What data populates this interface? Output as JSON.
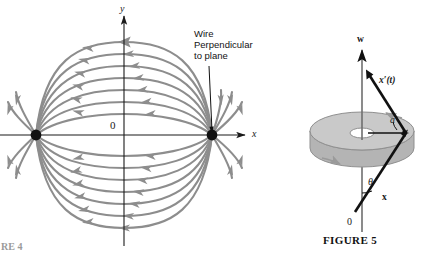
{
  "figure": {
    "caption": "FIGURE 5",
    "caption_stub_left": "RE 4"
  },
  "left_panel": {
    "name": "magnetic-field-lines-diagram",
    "axes": {
      "x_label": "x",
      "y_label": "y",
      "origin_label": "0"
    },
    "callout": {
      "line1": "Wire",
      "line2": "Perpendicular",
      "line3": "to plane"
    },
    "poles": [
      {
        "name": "left-wire-point",
        "cx": 36,
        "cy": 135
      },
      {
        "name": "right-wire-point",
        "cx": 212,
        "cy": 135
      }
    ],
    "field_line_count": 14,
    "flow_direction": "leftward"
  },
  "right_panel": {
    "name": "disk-vector-diagram",
    "labels": {
      "w_vector": "w",
      "velocity_vector": "x′(t)",
      "position_vector": "x",
      "angle": "θ",
      "origin": "0",
      "radius": "a"
    },
    "disk": {
      "outer_rx": 52,
      "outer_ry": 19,
      "thickness": 17,
      "hole_rx": 12,
      "hole_ry": 5
    }
  },
  "colors": {
    "field_line": "#8d8d8d",
    "axis": "#1a1a1a",
    "pole_dot": "#111111",
    "disk_top": "#c9c9c9",
    "disk_side": "#b4b4b4",
    "disk_edge": "#8f8f8f",
    "vector": "#111111",
    "background": "#ffffff"
  }
}
